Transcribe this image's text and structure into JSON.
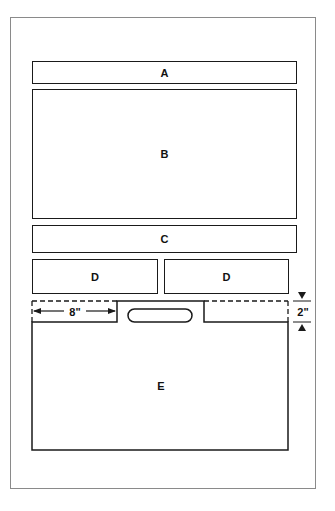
{
  "diagram": {
    "panels": [
      {
        "id": "A",
        "label": "A"
      },
      {
        "id": "B",
        "label": "B"
      },
      {
        "id": "C",
        "label": "C"
      },
      {
        "id": "D-left",
        "label": "D"
      },
      {
        "id": "D-right",
        "label": "D"
      },
      {
        "id": "E",
        "label": "E"
      }
    ],
    "dimensions": {
      "notch_width": "8\"",
      "notch_depth": "2\""
    },
    "colors": {
      "line": "#1a1a1a",
      "frame": "#8a8a8a",
      "background": "#ffffff"
    }
  }
}
